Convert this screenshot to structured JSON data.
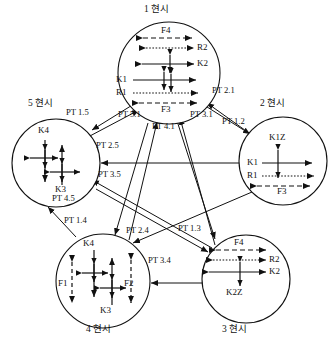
{
  "diagram": {
    "type": "state-transition-graph",
    "style": {
      "stroke": "#111111",
      "fill": "#ffffff",
      "background": "#ffffff",
      "dashed_stroke": "#444444"
    },
    "nodes": [
      {
        "id": "n1",
        "title": "1 현시",
        "title_pos": {
          "x": 144,
          "y": 9
        },
        "cx": 169,
        "cy": 73,
        "r": 51,
        "inner_labels": [
          {
            "text": "F4",
            "x": 159,
            "y": 30,
            "align": "center"
          },
          {
            "text": "R2",
            "x": 196,
            "y": 45,
            "align": "left"
          },
          {
            "text": "K2",
            "x": 196,
            "y": 64,
            "align": "left"
          },
          {
            "text": "K1",
            "x": 117,
            "y": 80,
            "align": "left"
          },
          {
            "text": "R1",
            "x": 117,
            "y": 93,
            "align": "left"
          },
          {
            "text": "F3",
            "x": 159,
            "y": 111,
            "align": "center"
          }
        ]
      },
      {
        "id": "n2",
        "title": "2 현시",
        "title_pos": {
          "x": 260,
          "y": 104
        },
        "cx": 283,
        "cy": 161,
        "r": 44,
        "inner_labels": [
          {
            "text": "K1Z",
            "x": 283,
            "y": 143,
            "align": "center"
          },
          {
            "text": "K1",
            "x": 248,
            "y": 163,
            "align": "left"
          },
          {
            "text": "R1",
            "x": 248,
            "y": 176,
            "align": "left"
          },
          {
            "text": "F3",
            "x": 283,
            "y": 192,
            "align": "center"
          }
        ]
      },
      {
        "id": "n3",
        "title": "3 현시",
        "title_pos": {
          "x": 222,
          "y": 330
        },
        "cx": 246,
        "cy": 279,
        "r": 44,
        "inner_labels": [
          {
            "text": "F4",
            "x": 236,
            "y": 243,
            "align": "center"
          },
          {
            "text": "R2",
            "x": 268,
            "y": 256,
            "align": "left"
          },
          {
            "text": "K2",
            "x": 268,
            "y": 272,
            "align": "left"
          },
          {
            "text": "K2Z",
            "x": 237,
            "y": 291,
            "align": "center"
          }
        ]
      },
      {
        "id": "n4",
        "title": "4 현시",
        "title_pos": {
          "x": 86,
          "y": 330
        },
        "cx": 103,
        "cy": 281,
        "r": 47,
        "inner_labels": [
          {
            "text": "K4",
            "x": 89,
            "y": 243,
            "align": "center"
          },
          {
            "text": "F1",
            "x": 61,
            "y": 283,
            "align": "left"
          },
          {
            "text": "F2",
            "x": 126,
            "y": 283,
            "align": "left"
          },
          {
            "text": "K3",
            "x": 106,
            "y": 312,
            "align": "center"
          }
        ]
      },
      {
        "id": "n5",
        "title": "5 현시",
        "title_pos": {
          "x": 28,
          "y": 104
        },
        "cx": 56,
        "cy": 163,
        "r": 44,
        "inner_labels": [
          {
            "text": "K4",
            "x": 41,
            "y": 131,
            "align": "center"
          },
          {
            "text": "K3",
            "x": 58,
            "y": 190,
            "align": "center"
          }
        ]
      }
    ],
    "edge_labels": [
      {
        "text": "PT 2.1",
        "x": 214,
        "y": 91
      },
      {
        "text": "PT 1.2",
        "x": 225,
        "y": 120
      },
      {
        "text": "PT 3.1",
        "x": 192,
        "y": 114
      },
      {
        "text": "PT 4.1",
        "x": 155,
        "y": 126
      },
      {
        "text": "PT 5.1",
        "x": 121,
        "y": 114
      },
      {
        "text": "PT 1.5",
        "x": 80,
        "y": 112
      },
      {
        "text": "PT 2.5",
        "x": 97,
        "y": 145
      },
      {
        "text": "PT 3.5",
        "x": 100,
        "y": 174
      },
      {
        "text": "PT 4.5",
        "x": 74,
        "y": 198
      },
      {
        "text": "PT 1.4",
        "x": 85,
        "y": 220
      },
      {
        "text": "PT 2.4",
        "x": 130,
        "y": 230
      },
      {
        "text": "PT 3.4",
        "x": 152,
        "y": 260
      },
      {
        "text": "PT 1.3",
        "x": 183,
        "y": 228
      }
    ]
  }
}
